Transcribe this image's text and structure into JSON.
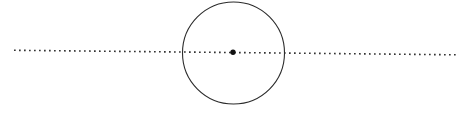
{
  "figure": {
    "width": 467,
    "height": 113,
    "background_color": "#ffffff"
  },
  "chart_data": {
    "type": "scatter",
    "title": "",
    "subtitle": "",
    "xlabel": "",
    "ylabel": "",
    "grid": false,
    "legend": "none",
    "xlim": [
      0,
      467
    ],
    "ylim": [
      0,
      113
    ],
    "annotations": [],
    "tick_labels": {
      "x": [],
      "y": []
    },
    "shapes": [
      {
        "name": "axis-line",
        "kind": "line",
        "style": "dotted",
        "x1": 14,
        "y1": 50.3,
        "x2": 456,
        "y2": 54.8,
        "stroke_color": "#333333",
        "stroke_width": 1.6,
        "dash_pattern": "1.7 3.3"
      },
      {
        "name": "main-circle",
        "kind": "circle",
        "cx": 233.5,
        "cy": 53,
        "r": 51,
        "stroke_color": "#2b2b2b",
        "stroke_width": 1.1,
        "fill": "none"
      },
      {
        "name": "center-point",
        "kind": "point",
        "cx": 233,
        "cy": 52.3,
        "r": 2.7,
        "fill": "#111111"
      }
    ],
    "series": [
      {
        "name": "center-point",
        "x": [
          233
        ],
        "y": [
          52.3
        ],
        "marker": "filled-circle",
        "color": "#111111"
      }
    ]
  }
}
